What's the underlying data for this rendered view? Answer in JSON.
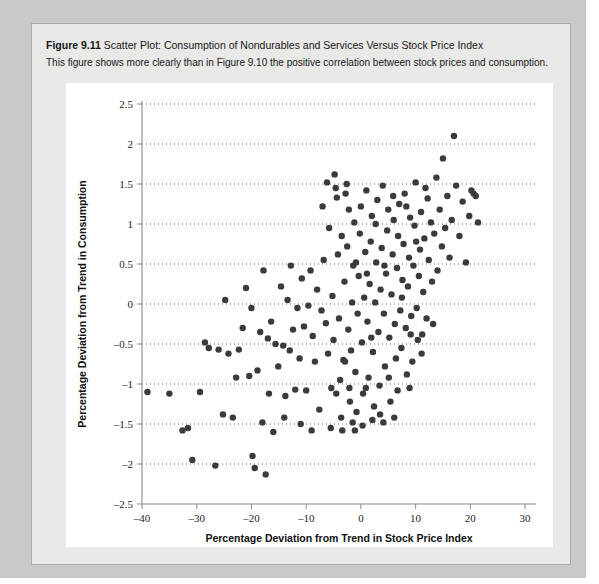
{
  "figure": {
    "number": "Figure 9.11",
    "title": "Scatter Plot: Consumption of Nondurables and Services Versus Stock Price Index",
    "description": "This figure shows more clearly than in Figure 9.10 the positive correlation between stock prices and consumption."
  },
  "colors": {
    "page_background": "#c9c9c9",
    "panel_background": "#e9e9e7",
    "plot_background": "#ffffff",
    "point_color": "#3b3b3f",
    "axis_color": "#8a8a8a",
    "grid_color": "#3a3a3a"
  },
  "chart_data": {
    "type": "scatter",
    "title": "Scatter Plot: Consumption of Nondurables and Services Versus Stock Price Index",
    "xlabel": "Percentage Deviation from Trend in Stock Price Index",
    "ylabel": "Percentage Deviation from Trend in Consumption",
    "xlim": [
      -40,
      32
    ],
    "ylim": [
      -2.5,
      2.5
    ],
    "xticks": [
      -40,
      -30,
      -20,
      -10,
      0,
      10,
      20,
      30
    ],
    "xticklabels": [
      "–40",
      "–30",
      "–20",
      "–10",
      "0",
      "10",
      "20",
      "30"
    ],
    "yticks": [
      -2.5,
      -2,
      -1.5,
      -1,
      -0.5,
      0,
      0.5,
      1,
      1.5,
      2,
      2.5
    ],
    "yticklabels": [
      "–2.5",
      "–2",
      "–1.5",
      "–1",
      "–0.5",
      "0",
      "0.5",
      "1",
      "1.5",
      "2",
      "2.5"
    ],
    "grid": "horizontal-dotted",
    "legend": null,
    "marker_size": 3.2,
    "series": [
      {
        "name": "Consumption vs Stock Price Index",
        "points": [
          [
            -39.0,
            -1.1
          ],
          [
            -32.6,
            -1.58
          ],
          [
            -31.6,
            -1.55
          ],
          [
            -30.8,
            -1.95
          ],
          [
            -29.4,
            -1.1
          ],
          [
            -27.8,
            -0.55
          ],
          [
            -26.6,
            -2.02
          ],
          [
            -26.0,
            -0.57
          ],
          [
            -25.2,
            -1.38
          ],
          [
            -24.2,
            -0.62
          ],
          [
            -23.4,
            -1.42
          ],
          [
            -22.3,
            -0.57
          ],
          [
            -21.6,
            -0.3
          ],
          [
            -21.0,
            0.2
          ],
          [
            -20.4,
            -0.9
          ],
          [
            -19.8,
            -1.9
          ],
          [
            -19.4,
            -2.05
          ],
          [
            -18.9,
            -0.83
          ],
          [
            -18.4,
            -0.35
          ],
          [
            -18.0,
            -1.48
          ],
          [
            -17.4,
            -2.13
          ],
          [
            -17.0,
            -0.43
          ],
          [
            -16.4,
            -0.22
          ],
          [
            -16.0,
            -1.6
          ],
          [
            -15.6,
            -0.5
          ],
          [
            -15.1,
            -0.78
          ],
          [
            -14.6,
            0.22
          ],
          [
            -14.2,
            -0.52
          ],
          [
            -13.8,
            -1.15
          ],
          [
            -13.4,
            0.05
          ],
          [
            -13.0,
            -0.58
          ],
          [
            -12.4,
            -0.32
          ],
          [
            -12.0,
            -1.07
          ],
          [
            -11.6,
            -0.05
          ],
          [
            -11.2,
            -0.68
          ],
          [
            -10.8,
            0.32
          ],
          [
            -10.4,
            -0.28
          ],
          [
            -10.0,
            -1.08
          ],
          [
            -9.6,
            -0.02
          ],
          [
            -9.2,
            0.42
          ],
          [
            -8.8,
            -0.4
          ],
          [
            -8.4,
            -0.72
          ],
          [
            -8.0,
            0.18
          ],
          [
            -7.6,
            -1.32
          ],
          [
            -7.2,
            -0.08
          ],
          [
            -6.8,
            0.55
          ],
          [
            -6.4,
            -0.24
          ],
          [
            -6.0,
            -0.62
          ],
          [
            -5.8,
            0.95
          ],
          [
            -5.4,
            -1.05
          ],
          [
            -5.2,
            0.1
          ],
          [
            -5.0,
            -0.45
          ],
          [
            -4.8,
            1.62
          ],
          [
            -4.6,
            1.45
          ],
          [
            -4.4,
            1.33
          ],
          [
            -4.2,
            0.62
          ],
          [
            -4.0,
            -0.18
          ],
          [
            -3.8,
            -0.95
          ],
          [
            -3.6,
            -1.42
          ],
          [
            -3.4,
            -1.58
          ],
          [
            -3.2,
            -0.7
          ],
          [
            -3.0,
            0.28
          ],
          [
            -2.8,
            1.38
          ],
          [
            -2.6,
            1.5
          ],
          [
            -2.5,
            0.72
          ],
          [
            -2.3,
            -0.32
          ],
          [
            -2.1,
            -1.05
          ],
          [
            -2.0,
            -1.22
          ],
          [
            -1.8,
            -0.58
          ],
          [
            -1.6,
            0.02
          ],
          [
            -1.4,
            0.48
          ],
          [
            -1.2,
            1.02
          ],
          [
            -1.0,
            -0.85
          ],
          [
            -0.8,
            -1.35
          ],
          [
            -0.6,
            -0.12
          ],
          [
            -0.4,
            0.35
          ],
          [
            -0.2,
            0.88
          ],
          [
            0.0,
            1.22
          ],
          [
            0.2,
            -0.48
          ],
          [
            0.4,
            -1.12
          ],
          [
            0.6,
            0.08
          ],
          [
            0.8,
            0.65
          ],
          [
            1.0,
            1.42
          ],
          [
            1.2,
            -0.22
          ],
          [
            1.4,
            -0.92
          ],
          [
            1.6,
            0.25
          ],
          [
            1.8,
            0.78
          ],
          [
            2.0,
            1.1
          ],
          [
            2.2,
            -0.6
          ],
          [
            2.4,
            -1.28
          ],
          [
            2.6,
            0.02
          ],
          [
            2.8,
            0.52
          ],
          [
            3.0,
            1.3
          ],
          [
            3.2,
            -0.35
          ],
          [
            3.4,
            -1.02
          ],
          [
            3.6,
            0.18
          ],
          [
            3.8,
            0.7
          ],
          [
            4.0,
            1.48
          ],
          [
            4.2,
            -0.12
          ],
          [
            4.4,
            -0.78
          ],
          [
            4.6,
            0.38
          ],
          [
            4.8,
            0.92
          ],
          [
            5.0,
            1.18
          ],
          [
            5.2,
            -0.42
          ],
          [
            5.4,
            -1.22
          ],
          [
            5.6,
            0.12
          ],
          [
            5.8,
            0.62
          ],
          [
            6.0,
            1.05
          ],
          [
            6.2,
            -0.25
          ],
          [
            6.4,
            -0.68
          ],
          [
            6.6,
            0.45
          ],
          [
            6.8,
            0.85
          ],
          [
            7.0,
            1.25
          ],
          [
            7.2,
            -0.08
          ],
          [
            7.4,
            -0.55
          ],
          [
            7.6,
            0.3
          ],
          [
            7.8,
            0.75
          ],
          [
            8.0,
            1.38
          ],
          [
            8.2,
            -0.3
          ],
          [
            8.4,
            -0.88
          ],
          [
            8.6,
            0.22
          ],
          [
            8.8,
            0.58
          ],
          [
            9.0,
            1.08
          ],
          [
            9.2,
            -0.15
          ],
          [
            9.4,
            -0.72
          ],
          [
            9.6,
            0.48
          ],
          [
            9.8,
            0.98
          ],
          [
            10.0,
            1.52
          ],
          [
            10.2,
            -0.05
          ],
          [
            10.4,
            -0.45
          ],
          [
            10.6,
            0.35
          ],
          [
            10.8,
            0.68
          ],
          [
            11.0,
            1.15
          ],
          [
            11.2,
            -0.38
          ],
          [
            11.4,
            0.15
          ],
          [
            11.6,
            0.82
          ],
          [
            11.8,
            1.45
          ],
          [
            12.0,
            -0.18
          ],
          [
            12.4,
            0.55
          ],
          [
            12.8,
            1.02
          ],
          [
            13.0,
            0.28
          ],
          [
            13.4,
            0.88
          ],
          [
            13.8,
            1.58
          ],
          [
            14.0,
            0.42
          ],
          [
            14.4,
            1.18
          ],
          [
            14.8,
            0.72
          ],
          [
            15.0,
            1.82
          ],
          [
            15.4,
            0.95
          ],
          [
            15.8,
            1.35
          ],
          [
            16.2,
            0.58
          ],
          [
            16.6,
            1.05
          ],
          [
            17.0,
            2.1
          ],
          [
            17.4,
            1.48
          ],
          [
            18.0,
            0.85
          ],
          [
            18.6,
            1.28
          ],
          [
            19.2,
            0.52
          ],
          [
            19.8,
            1.1
          ],
          [
            20.2,
            1.42
          ],
          [
            20.6,
            1.38
          ],
          [
            21.0,
            1.35
          ],
          [
            21.4,
            1.02
          ],
          [
            -35.0,
            -1.12
          ],
          [
            -28.5,
            -0.48
          ],
          [
            -24.8,
            0.05
          ],
          [
            -20.0,
            -0.05
          ],
          [
            -17.8,
            0.42
          ],
          [
            -14.0,
            -1.42
          ],
          [
            -11.0,
            -1.5
          ],
          [
            -9.0,
            -1.58
          ],
          [
            -7.0,
            1.22
          ],
          [
            -6.2,
            1.52
          ],
          [
            -5.5,
            -1.55
          ],
          [
            -4.5,
            -1.12
          ],
          [
            -3.5,
            0.85
          ],
          [
            -2.9,
            -0.72
          ],
          [
            -2.2,
            1.18
          ],
          [
            -1.5,
            -1.48
          ],
          [
            -0.9,
            0.52
          ],
          [
            0.3,
            -1.52
          ],
          [
            1.1,
            0.38
          ],
          [
            1.9,
            -0.42
          ],
          [
            2.7,
            1.0
          ],
          [
            3.5,
            -1.38
          ],
          [
            4.3,
            0.48
          ],
          [
            5.1,
            -0.92
          ],
          [
            5.9,
            1.35
          ],
          [
            6.7,
            -1.08
          ],
          [
            7.5,
            0.08
          ],
          [
            8.3,
            1.22
          ],
          [
            9.1,
            -0.38
          ],
          [
            10.1,
            0.78
          ],
          [
            11.1,
            -0.62
          ],
          [
            12.2,
            1.32
          ],
          [
            13.2,
            -0.25
          ],
          [
            4.1,
            -1.48
          ],
          [
            6.1,
            -1.42
          ],
          [
            2.1,
            -1.45
          ],
          [
            0.9,
            -1.05
          ],
          [
            -1.1,
            -1.58
          ],
          [
            8.9,
            -1.05
          ],
          [
            -12.8,
            0.48
          ],
          [
            -16.8,
            -1.12
          ],
          [
            -22.8,
            -0.92
          ]
        ]
      }
    ]
  }
}
